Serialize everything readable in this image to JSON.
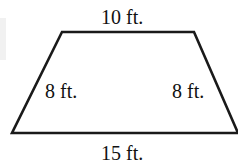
{
  "diagram": {
    "shape": "trapezoid",
    "labels": {
      "top": "10 ft.",
      "bottom": "15 ft.",
      "left": "8 ft.",
      "right": "8 ft."
    },
    "stroke_color": "#1a1a1a"
  }
}
